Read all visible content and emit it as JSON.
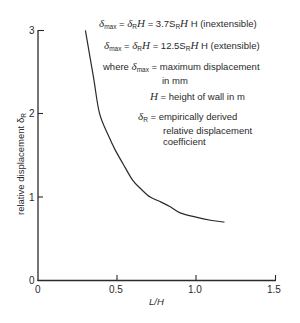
{
  "chart_data": {
    "type": "line",
    "title": "",
    "xlabel": "L/H",
    "ylabel": "relative displacement δR",
    "xlim": [
      0,
      1.5
    ],
    "ylim": [
      0,
      3
    ],
    "x_ticks": [
      "0",
      "0.5",
      "1.0",
      "1.5"
    ],
    "y_ticks": [
      "0",
      "1",
      "2",
      "3"
    ],
    "grid": false,
    "legend": null,
    "series": [
      {
        "name": "δR curve",
        "x": [
          0.3,
          0.35,
          0.39,
          0.45,
          0.49,
          0.55,
          0.6,
          0.65,
          0.71,
          0.78,
          0.84,
          0.9,
          1.0,
          1.1,
          1.18
        ],
        "y": [
          3.0,
          2.45,
          2.0,
          1.72,
          1.56,
          1.36,
          1.2,
          1.1,
          1.0,
          0.94,
          0.88,
          0.81,
          0.76,
          0.72,
          0.7
        ]
      }
    ],
    "annotations": [
      "δmax = δR H = 3.7 SR H (inextensible)",
      "δmax = δR H = 12.5 SR H (extensible)",
      "where δmax = maximum displacement in mm",
      "H = height of wall in m",
      "δR = empirically derived relative displacement coefficient"
    ]
  },
  "labels": {
    "x_axis_title": "L/H",
    "y_axis_title": "relative displacement δ",
    "y_axis_title_sub": "R",
    "x_ticks": [
      "0",
      "0.5",
      "1.0",
      "1.5"
    ],
    "y_ticks": [
      "0",
      "1",
      "2",
      "3"
    ]
  },
  "annotations": {
    "eq1": {
      "lhs_sub": "max",
      "mid": "δ",
      "mid_sub": "R",
      "rhs": "= 3.7S",
      "rhs_sub": "R",
      "tail": "H (inextensible)"
    },
    "eq2": {
      "lhs_sub": "max",
      "mid": "δ",
      "mid_sub": "R",
      "rhs": "= 12.5S",
      "rhs_sub": "R",
      "tail": "H (extensible)"
    },
    "where_prefix": "where",
    "where_sub": "max",
    "where_text": "= maximum displacement",
    "where_text2": "in mm",
    "h_def": "= height of wall in m",
    "dr_sub": "R",
    "dr_text1": "= empirically derived",
    "dr_text2": "relative displacement",
    "dr_text3": "coefficient"
  },
  "colors": {
    "line": "#2a2a2a",
    "axis": "#2a2a2a",
    "background": "#ffffff"
  }
}
